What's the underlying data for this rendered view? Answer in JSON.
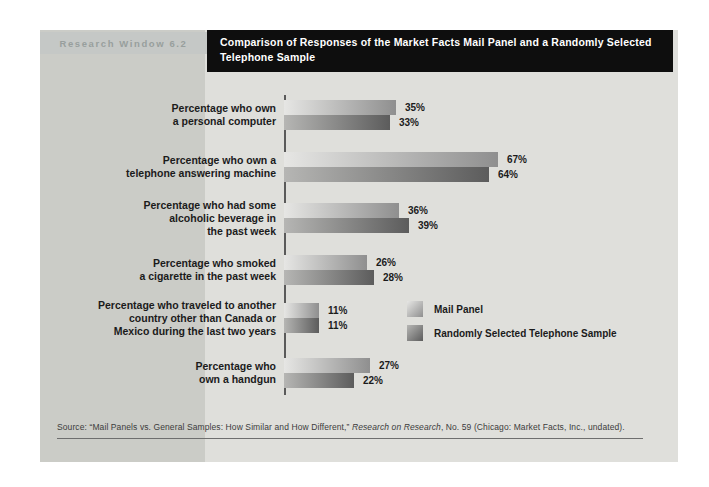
{
  "header": {
    "kicker": "Research Window 6.2",
    "title_lines": [
      "Comparison of Responses of the Market Facts Mail Panel and a Randomly Selected",
      "Telephone Sample"
    ]
  },
  "chart_data": {
    "type": "bar",
    "orientation": "horizontal",
    "title": "Comparison of Responses of the Market Facts Mail Panel and a Randomly Selected Telephone Sample",
    "xlim": [
      0,
      70
    ],
    "value_suffix": "%",
    "grid": false,
    "legend_position": "right-middle",
    "categories": [
      [
        "Percentage who own",
        "a personal computer"
      ],
      [
        "Percentage who own a",
        "telephone answering machine"
      ],
      [
        "Percentage who had some",
        "alcoholic beverage in",
        "the past week"
      ],
      [
        "Percentage who smoked",
        "a cigarette in the past week"
      ],
      [
        "Percentage who traveled to another",
        "country other than Canada or",
        "Mexico during the last two years"
      ],
      [
        "Percentage who",
        "own a handgun"
      ]
    ],
    "series": [
      {
        "name": "Mail Panel",
        "values": [
          35,
          67,
          36,
          26,
          11,
          27
        ]
      },
      {
        "name": "Randomly Selected Telephone Sample",
        "values": [
          33,
          64,
          39,
          28,
          11,
          22
        ]
      }
    ],
    "legend": [
      "Mail Panel",
      "Randomly Selected Telephone Sample"
    ],
    "colors": {
      "mail": [
        "#e6e6e4",
        "#8f8f8f"
      ],
      "telephone": [
        "#b6b6b4",
        "#5c5c5c"
      ],
      "panel_bg": "#dfdfdb",
      "left_strip_bg": "#cbccc7",
      "kicker_band_bg": "#c5c8c6",
      "title_box_bg": "#0e0e0e",
      "axis": "#5a5a5a"
    }
  },
  "source": {
    "prefix": "Source: “Mail Panels vs. General Samples: How Similar and How Different,” ",
    "italic": "Research on Research",
    "suffix": ", No. 59 (Chicago: Market Facts, Inc., undated)."
  }
}
